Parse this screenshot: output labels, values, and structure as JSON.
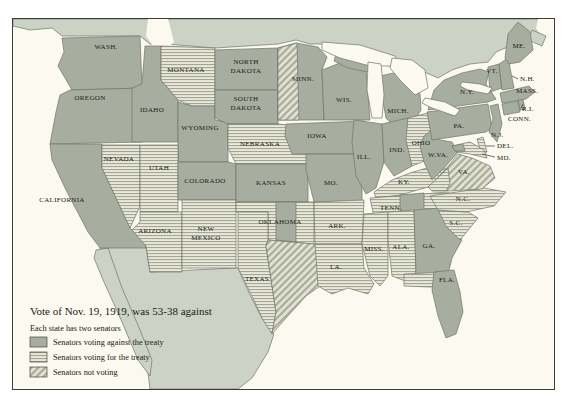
{
  "title": "Vote of Nov. 19, 1919, was 53-38 against",
  "subtitle": "Each state has two senators",
  "legend": {
    "against_label": "Senators voting against the treaty",
    "for_label": "Senators voting for the treaty",
    "not_voting_label": "Senators not voting"
  },
  "colors": {
    "against_fill": "#a8ae9f",
    "stripe_bg": "#ebe8d8",
    "stripe_line": "#a0a796",
    "hatch_bg": "#e4e1d0",
    "hatch_line": "#a8ae9e",
    "neighbor_land": "#cdd2c6",
    "ocean": "#fbf9f0",
    "border": "#6e7668",
    "text": "#1a1a1a"
  },
  "states": [
    {
      "id": "washington",
      "lines": [
        "WASH."
      ],
      "votes": [
        "against",
        "against"
      ]
    },
    {
      "id": "oregon",
      "lines": [
        "OREGON"
      ],
      "votes": [
        "against",
        "against"
      ]
    },
    {
      "id": "california",
      "lines": [
        "CALIFORNIA"
      ],
      "votes": [
        "against",
        "against"
      ]
    },
    {
      "id": "nevada",
      "lines": [
        "NEVADA"
      ],
      "votes": [
        "for",
        "for"
      ]
    },
    {
      "id": "idaho",
      "lines": [
        "IDAHO"
      ],
      "votes": [
        "against",
        "against"
      ]
    },
    {
      "id": "montana",
      "lines": [
        "MONTANA"
      ],
      "votes": [
        "for",
        "for"
      ]
    },
    {
      "id": "wyoming",
      "lines": [
        "WYOMING"
      ],
      "votes": [
        "against",
        "against"
      ]
    },
    {
      "id": "utah",
      "lines": [
        "UTAH"
      ],
      "votes": [
        "for",
        "for"
      ]
    },
    {
      "id": "colorado",
      "lines": [
        "COLORADO"
      ],
      "votes": [
        "against",
        "against"
      ]
    },
    {
      "id": "arizona",
      "lines": [
        "ARIZONA"
      ],
      "votes": [
        "for",
        "for"
      ]
    },
    {
      "id": "new-mexico",
      "lines": [
        "NEW",
        "MEXICO"
      ],
      "votes": [
        "for",
        "for"
      ]
    },
    {
      "id": "north-dakota",
      "lines": [
        "NORTH",
        "DAKOTA"
      ],
      "votes": [
        "against",
        "against"
      ]
    },
    {
      "id": "south-dakota",
      "lines": [
        "SOUTH",
        "DAKOTA"
      ],
      "votes": [
        "against",
        "against"
      ]
    },
    {
      "id": "nebraska",
      "lines": [
        "NEBRASKA"
      ],
      "votes": [
        "for",
        "for"
      ]
    },
    {
      "id": "kansas",
      "lines": [
        "KANSAS"
      ],
      "votes": [
        "against",
        "against"
      ]
    },
    {
      "id": "oklahoma",
      "lines": [
        "OKLAHOMA"
      ],
      "votes": [
        "for",
        "against"
      ]
    },
    {
      "id": "texas",
      "lines": [
        "TEXAS"
      ],
      "votes": [
        "for",
        "not_voting"
      ]
    },
    {
      "id": "minnesota",
      "lines": [
        "MINN."
      ],
      "votes": [
        "not_voting",
        "against"
      ]
    },
    {
      "id": "iowa",
      "lines": [
        "IOWA"
      ],
      "votes": [
        "against",
        "against"
      ]
    },
    {
      "id": "missouri",
      "lines": [
        "MO."
      ],
      "votes": [
        "against",
        "against"
      ]
    },
    {
      "id": "arkansas",
      "lines": [
        "ARK."
      ],
      "votes": [
        "for",
        "for"
      ]
    },
    {
      "id": "louisiana",
      "lines": [
        "LA."
      ],
      "votes": [
        "for",
        "for"
      ]
    },
    {
      "id": "wisconsin",
      "lines": [
        "WIS."
      ],
      "votes": [
        "against",
        "against"
      ]
    },
    {
      "id": "illinois",
      "lines": [
        "ILL."
      ],
      "votes": [
        "against",
        "against"
      ]
    },
    {
      "id": "michigan",
      "lines": [
        "MICH."
      ],
      "votes": [
        "against",
        "against"
      ]
    },
    {
      "id": "indiana",
      "lines": [
        "IND."
      ],
      "votes": [
        "against",
        "against"
      ]
    },
    {
      "id": "ohio",
      "lines": [
        "OHIO"
      ],
      "votes": [
        "for",
        "for"
      ]
    },
    {
      "id": "kentucky",
      "lines": [
        "KY."
      ],
      "votes": [
        "for",
        "for"
      ]
    },
    {
      "id": "tennessee",
      "lines": [
        "TENN."
      ],
      "votes": [
        "for",
        "against"
      ]
    },
    {
      "id": "mississippi",
      "lines": [
        "MISS."
      ],
      "votes": [
        "for",
        "for"
      ]
    },
    {
      "id": "alabama",
      "lines": [
        "ALA."
      ],
      "votes": [
        "for",
        "for"
      ]
    },
    {
      "id": "georgia",
      "lines": [
        "GA."
      ],
      "votes": [
        "against",
        "against"
      ]
    },
    {
      "id": "florida",
      "lines": [
        "FLA."
      ],
      "votes": [
        "for",
        "against"
      ]
    },
    {
      "id": "south-carolina",
      "lines": [
        "S.C."
      ],
      "votes": [
        "for",
        "for"
      ]
    },
    {
      "id": "north-carolina",
      "lines": [
        "N.C."
      ],
      "votes": [
        "for",
        "for"
      ]
    },
    {
      "id": "virginia",
      "lines": [
        "VA."
      ],
      "votes": [
        "for",
        "not_voting"
      ]
    },
    {
      "id": "west-virginia",
      "lines": [
        "W.VA."
      ],
      "votes": [
        "against",
        "against"
      ]
    },
    {
      "id": "pennsylvania",
      "lines": [
        "PA."
      ],
      "votes": [
        "against",
        "against"
      ]
    },
    {
      "id": "new-york",
      "lines": [
        "N.Y."
      ],
      "votes": [
        "against",
        "against"
      ]
    },
    {
      "id": "new-jersey",
      "lines": [
        "N.J."
      ],
      "votes": [
        "against",
        "against"
      ]
    },
    {
      "id": "delaware",
      "lines": [
        "DEL."
      ],
      "votes": [
        "for",
        "against"
      ]
    },
    {
      "id": "maryland",
      "lines": [
        "MD."
      ],
      "votes": [
        "for",
        "against"
      ]
    },
    {
      "id": "connecticut",
      "lines": [
        "CONN."
      ],
      "votes": [
        "against",
        "against"
      ]
    },
    {
      "id": "rhode-island",
      "lines": [
        "R.I."
      ],
      "votes": [
        "against",
        "against"
      ]
    },
    {
      "id": "massachusetts",
      "lines": [
        "MASS."
      ],
      "votes": [
        "against",
        "against"
      ]
    },
    {
      "id": "vermont",
      "lines": [
        "VT."
      ],
      "votes": [
        "against",
        "against"
      ]
    },
    {
      "id": "new-hampshire",
      "lines": [
        "N.H."
      ],
      "votes": [
        "against",
        "against"
      ]
    },
    {
      "id": "maine",
      "lines": [
        "ME."
      ],
      "votes": [
        "against",
        "against"
      ]
    }
  ]
}
